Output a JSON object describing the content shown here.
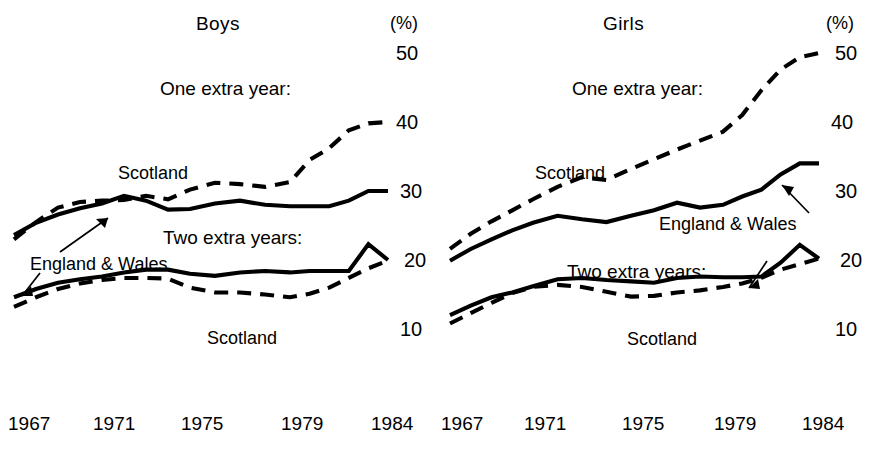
{
  "figure": {
    "background": "#ffffff",
    "ink_color": "#000000"
  },
  "panels": [
    {
      "key": "boys",
      "title": "Boys",
      "percent_symbol": "(%)",
      "group_label_one": "One extra year:",
      "group_label_two": "Two extra years:",
      "label_scotland_upper": "Scotland",
      "label_scotland_lower": "Scotland",
      "label_england_wales": "England & Wales",
      "yticks": [
        "50",
        "40",
        "30",
        "20",
        "10"
      ],
      "xticks": [
        "1967",
        "1971",
        "1975",
        "1979",
        "1984"
      ]
    },
    {
      "key": "girls",
      "title": "Girls",
      "percent_symbol": "(%)",
      "group_label_one": "One extra year:",
      "group_label_two": "Two extra years:",
      "label_scotland_upper": "Scotland",
      "label_scotland_lower": "Scotland",
      "label_england_wales": "England & Wales",
      "yticks": [
        "50",
        "40",
        "30",
        "20",
        "10"
      ],
      "xticks": [
        "1967",
        "1971",
        "1975",
        "1979",
        "1984"
      ]
    }
  ],
  "chart_data": {
    "type": "line",
    "xlabel": "",
    "ylabel": "(%)",
    "ylim": [
      5,
      52
    ],
    "yticks": [
      10,
      20,
      30,
      40,
      50
    ],
    "xlim": [
      1967,
      1984
    ],
    "xticks": [
      1967,
      1971,
      1975,
      1979,
      1984
    ],
    "grid": false,
    "legend": "inline annotations",
    "panels": [
      {
        "name": "Boys",
        "x": [
          1967,
          1968,
          1969,
          1970,
          1971,
          1972,
          1973,
          1974,
          1975,
          1976,
          1977,
          1978,
          1979,
          1980,
          1981,
          1982,
          1983,
          1984
        ],
        "series": [
          {
            "name": "One extra year: Scotland",
            "group": "One extra year",
            "region": "Scotland",
            "style": "dashed",
            "values": [
              23.0,
              25.5,
              27.6,
              28.4,
              28.6,
              28.7,
              29.3,
              28.8,
              30.2,
              31.2,
              31.0,
              30.6,
              31.3,
              34.5,
              36.2,
              38.8,
              39.8,
              40.0
            ]
          },
          {
            "name": "One extra year: England & Wales",
            "group": "One extra year",
            "region": "England & Wales",
            "style": "solid",
            "values": [
              23.6,
              25.4,
              26.6,
              27.5,
              28.2,
              29.3,
              28.6,
              27.3,
              27.4,
              28.2,
              28.6,
              28.0,
              27.8,
              27.8,
              27.8,
              28.6,
              30.0,
              30.0
            ]
          },
          {
            "name": "Two extra years: England & Wales",
            "group": "Two extra years",
            "region": "England & Wales",
            "style": "solid",
            "values": [
              14.6,
              15.8,
              16.7,
              17.2,
              17.6,
              18.2,
              18.6,
              18.6,
              18.0,
              17.7,
              18.2,
              18.4,
              18.2,
              18.4,
              18.4,
              18.4,
              22.3,
              20.0
            ]
          },
          {
            "name": "Two extra years: Scotland",
            "group": "Two extra years",
            "region": "Scotland",
            "style": "dashed",
            "values": [
              13.2,
              14.6,
              15.8,
              16.6,
              17.1,
              17.4,
              17.4,
              17.3,
              16.0,
              15.3,
              15.3,
              15.0,
              14.6,
              15.1,
              16.0,
              17.4,
              18.8,
              19.9
            ]
          }
        ]
      },
      {
        "name": "Girls",
        "x": [
          1967,
          1968,
          1969,
          1970,
          1971,
          1972,
          1973,
          1974,
          1975,
          1976,
          1977,
          1978,
          1979,
          1980,
          1981,
          1982,
          1983,
          1984
        ],
        "series": [
          {
            "name": "One extra year: Scotland",
            "group": "One extra year",
            "region": "Scotland",
            "style": "dashed",
            "values": [
              21.6,
              23.8,
              25.6,
              27.2,
              28.8,
              30.6,
              32.0,
              31.6,
              33.2,
              34.6,
              36.0,
              37.3,
              38.6,
              41.0,
              44.6,
              47.6,
              49.4,
              50.0
            ]
          },
          {
            "name": "One extra year: England & Wales",
            "group": "One extra year",
            "region": "England & Wales",
            "style": "solid",
            "values": [
              19.9,
              21.6,
              23.0,
              24.3,
              25.4,
              26.4,
              25.9,
              25.5,
              26.4,
              27.2,
              28.3,
              27.6,
              28.0,
              29.2,
              30.2,
              32.4,
              34.0,
              34.0
            ]
          },
          {
            "name": "Two extra years: England & Wales",
            "group": "Two extra years",
            "region": "England & Wales",
            "style": "solid",
            "values": [
              12.0,
              13.4,
              14.6,
              15.3,
              16.2,
              17.2,
              17.4,
              17.1,
              16.9,
              16.7,
              17.4,
              17.6,
              17.5,
              17.5,
              17.6,
              19.6,
              22.2,
              20.2
            ]
          },
          {
            "name": "Two extra years: Scotland",
            "group": "Two extra years",
            "region": "Scotland",
            "style": "dashed",
            "values": [
              10.8,
              12.3,
              13.8,
              15.2,
              16.1,
              16.4,
              16.1,
              15.4,
              14.7,
              14.8,
              15.3,
              15.6,
              16.1,
              16.6,
              17.4,
              18.6,
              19.4,
              20.2
            ]
          }
        ]
      }
    ]
  }
}
